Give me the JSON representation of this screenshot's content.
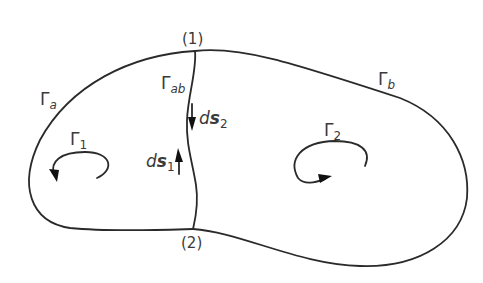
{
  "diagram": {
    "points": [
      {
        "id": "1",
        "label": "(1)"
      },
      {
        "id": "2",
        "label": "(2)"
      }
    ],
    "boundaries": {
      "gamma_a": {
        "symbol": "Γ",
        "subscript": "a"
      },
      "gamma_b": {
        "symbol": "Γ",
        "subscript": "b"
      },
      "gamma_ab": {
        "symbol": "Γ",
        "subscript": "ab"
      }
    },
    "circulations": {
      "gamma_1": {
        "symbol": "Γ",
        "subscript": "1",
        "direction": "counterclockwise"
      },
      "gamma_2": {
        "symbol": "Γ",
        "subscript": "2",
        "direction": "counterclockwise"
      }
    },
    "line_elements": {
      "ds_1": {
        "prefix": "d",
        "symbol": "s",
        "subscript": "1",
        "direction": "up"
      },
      "ds_2": {
        "prefix": "d",
        "symbol": "s",
        "subscript": "2",
        "direction": "down"
      }
    },
    "colors": {
      "stroke": "#2a2a2a",
      "text": "#3a3a3a",
      "background": "#ffffff"
    }
  }
}
